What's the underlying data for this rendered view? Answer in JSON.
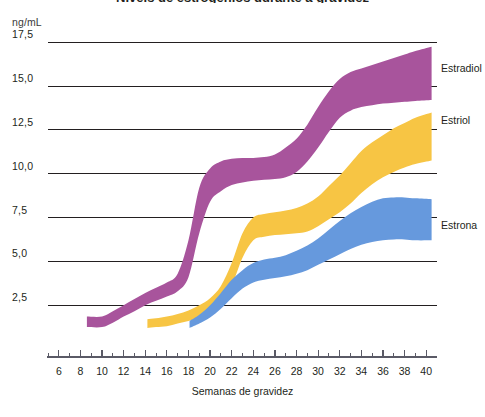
{
  "title": "Níveis de estrogênios durante a gravidez",
  "unit_label": "ng/mL",
  "axis": {
    "x_title": "Semanas de gravidez",
    "x_ticks": [
      6,
      8,
      10,
      12,
      14,
      16,
      18,
      20,
      22,
      24,
      26,
      28,
      30,
      32,
      34,
      36,
      38,
      40
    ],
    "x_tick_labels": [
      "6",
      "8",
      "10",
      "12",
      "14",
      "16",
      "18",
      "20",
      "22",
      "24",
      "26",
      "28",
      "30",
      "32",
      "34",
      "36",
      "38",
      "40"
    ],
    "y_ticks": [
      2.5,
      5.0,
      7.5,
      10.0,
      12.5,
      15.0,
      17.5
    ],
    "y_tick_labels": [
      "2,5",
      "5,0",
      "7,5",
      "10,0",
      "12,5",
      "15,0",
      "17,5"
    ]
  },
  "series_labels": {
    "estradiol": "Estradiol",
    "estriol": "Estriol",
    "estrona": "Estrona"
  },
  "colors": {
    "estradiol": "#a8549c",
    "estriol": "#f7c544",
    "estrona": "#6699dd",
    "gridline": "#231f20",
    "axis": "#5a5a66",
    "text": "#231f20"
  },
  "chart_data": {
    "type": "area",
    "title": "Níveis de estrogênios durante a gravidez",
    "xlabel": "Semanas de gravidez",
    "ylabel": "ng/mL",
    "xlim": [
      5,
      41
    ],
    "ylim": [
      0,
      18.2
    ],
    "grid": true,
    "legend_position": "right-inline",
    "series": [
      {
        "name": "Estradiol",
        "color": "#a8549c",
        "band": true,
        "x": [
          8.6,
          10,
          11,
          12,
          13,
          14,
          15,
          16,
          17,
          18,
          19,
          20,
          21,
          22,
          23,
          24,
          25,
          26,
          27,
          28,
          29,
          30,
          31,
          32,
          33,
          34,
          35,
          36,
          37,
          38,
          39,
          40.5
        ],
        "lower": [
          1.25,
          1.25,
          1.5,
          1.85,
          2.15,
          2.5,
          2.75,
          3.0,
          3.3,
          4.1,
          6.6,
          8.4,
          9.0,
          9.35,
          9.5,
          9.6,
          9.65,
          9.7,
          9.8,
          10.1,
          10.7,
          11.5,
          12.4,
          13.2,
          13.6,
          13.8,
          13.9,
          14.0,
          14.05,
          14.1,
          14.15,
          14.2
        ],
        "upper": [
          1.85,
          1.85,
          2.15,
          2.5,
          2.85,
          3.2,
          3.5,
          3.8,
          4.3,
          6.2,
          9.2,
          10.3,
          10.7,
          10.85,
          10.9,
          10.9,
          10.95,
          11.1,
          11.5,
          12.0,
          12.8,
          13.8,
          14.7,
          15.4,
          15.8,
          16.0,
          16.2,
          16.4,
          16.6,
          16.8,
          17.0,
          17.25
        ]
      },
      {
        "name": "Estriol",
        "color": "#f7c544",
        "band": true,
        "x": [
          14.2,
          15,
          16,
          17,
          18,
          19,
          20,
          21,
          22,
          23,
          24,
          25,
          26,
          27,
          28,
          29,
          30,
          31,
          32,
          33,
          34,
          35,
          36,
          37,
          38,
          39,
          40.5
        ],
        "lower": [
          1.2,
          1.25,
          1.3,
          1.45,
          1.6,
          1.8,
          2.1,
          2.6,
          3.6,
          5.2,
          6.2,
          6.4,
          6.5,
          6.55,
          6.6,
          6.7,
          7.0,
          7.4,
          7.8,
          8.3,
          8.9,
          9.4,
          9.8,
          10.1,
          10.35,
          10.55,
          10.75
        ],
        "upper": [
          1.7,
          1.75,
          1.85,
          2.0,
          2.2,
          2.5,
          2.9,
          3.6,
          4.9,
          6.6,
          7.5,
          7.7,
          7.8,
          7.9,
          8.05,
          8.3,
          8.7,
          9.3,
          9.9,
          10.6,
          11.3,
          11.8,
          12.2,
          12.6,
          12.9,
          13.2,
          13.5
        ]
      },
      {
        "name": "Estrona",
        "color": "#6699dd",
        "band": true,
        "x": [
          18.1,
          19,
          20,
          21,
          22,
          23,
          24,
          25,
          26,
          27,
          28,
          29,
          30,
          31,
          32,
          33,
          34,
          35,
          36,
          37,
          38,
          39,
          40.5
        ],
        "lower": [
          1.2,
          1.45,
          1.8,
          2.3,
          2.9,
          3.45,
          3.8,
          3.95,
          4.05,
          4.15,
          4.3,
          4.5,
          4.8,
          5.1,
          5.4,
          5.7,
          5.95,
          6.1,
          6.2,
          6.25,
          6.25,
          6.2,
          6.2
        ],
        "upper": [
          1.6,
          1.95,
          2.5,
          3.2,
          3.95,
          4.5,
          4.9,
          5.1,
          5.2,
          5.35,
          5.6,
          5.9,
          6.3,
          6.8,
          7.3,
          7.75,
          8.1,
          8.4,
          8.6,
          8.65,
          8.65,
          8.6,
          8.55
        ]
      }
    ]
  }
}
